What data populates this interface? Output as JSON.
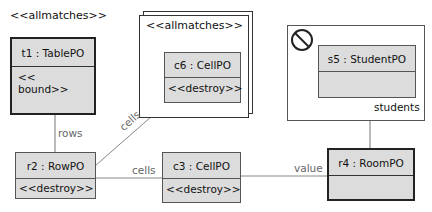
{
  "diagram": {
    "type": "object-pattern-diagram",
    "stereotypes": {
      "left_allmatches": "<<allmatches>>",
      "center_allmatches": "<<allmatches>>"
    },
    "objects": {
      "t1": {
        "title": "t1 : TablePO",
        "body": "<< bound>>",
        "bold_border": true
      },
      "c6": {
        "title": "c6 : CellPO",
        "body": "<<destroy>>",
        "bold_border": false
      },
      "s5": {
        "title": "s5 : StudentPO",
        "body": "",
        "bold_border": false
      },
      "r2": {
        "title": "r2 : RowPO",
        "body": "<<destroy>>",
        "bold_border": false
      },
      "c3": {
        "title": "c3 : CellPO",
        "body": "<<destroy>>",
        "bold_border": false
      },
      "r4": {
        "title": "r4 : RoomPO",
        "body": "",
        "bold_border": true
      }
    },
    "links": [
      {
        "from": "t1",
        "to": "r2",
        "label": "rows"
      },
      {
        "from": "r2",
        "to": "c6",
        "label": "cells"
      },
      {
        "from": "r2",
        "to": "c3",
        "label": "cells"
      },
      {
        "from": "c3",
        "to": "r4",
        "label": "value"
      },
      {
        "from": "s5",
        "to": "r4",
        "label": "students"
      }
    ],
    "negative_application_condition": {
      "icon": "forbidden-icon",
      "contains": "s5"
    },
    "colors": {
      "box_fill": "#dcdcdc",
      "border": "#555555",
      "link": "#888888",
      "label": "#666666"
    }
  }
}
